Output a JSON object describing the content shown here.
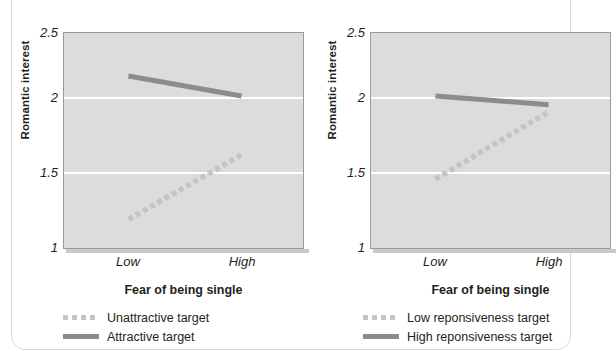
{
  "figure": {
    "panel_count": 2,
    "accent_solid_color": "#8c8c8c",
    "accent_dashed_color": "#c4c4c4",
    "plot_background_color": "#dcdcdc",
    "gridline_color": "#ffffff"
  },
  "panels": [
    {
      "id": "left",
      "ylabel": "Romantic interest",
      "xlabel": "Fear of being single",
      "yticks": [
        "2.5",
        "2",
        "1.5",
        "1"
      ],
      "xticks": [
        "Low",
        "High"
      ],
      "legend": [
        {
          "label": "Unattractive target",
          "style": "dashed"
        },
        {
          "label": "Attractive target",
          "style": "solid"
        }
      ]
    },
    {
      "id": "right",
      "ylabel": "Romantic interest",
      "xlabel": "Fear of being single",
      "yticks": [
        "2.5",
        "2",
        "1.5",
        "1"
      ],
      "xticks": [
        "Low",
        "High"
      ],
      "legend": [
        {
          "label": "Low reponsiveness target",
          "style": "dashed"
        },
        {
          "label": "High reponsiveness target",
          "style": "solid"
        }
      ]
    }
  ],
  "chart_data": [
    {
      "type": "line",
      "panel": "left",
      "title": "",
      "xlabel": "Fear of being single",
      "ylabel": "Romantic interest",
      "categories": [
        "Low",
        "High"
      ],
      "ylim": [
        1,
        2.5
      ],
      "yticks": [
        1,
        1.5,
        2,
        2.5
      ],
      "grid": true,
      "gridlines_at": [
        1.5,
        2
      ],
      "legend_position": "below",
      "series": [
        {
          "name": "Unattractive target",
          "style": "dashed",
          "color": "#c4c4c4",
          "values": [
            1.2,
            1.65
          ]
        },
        {
          "name": "Attractive target",
          "style": "solid",
          "color": "#8c8c8c",
          "values": [
            2.2,
            2.06
          ]
        }
      ]
    },
    {
      "type": "line",
      "panel": "right",
      "title": "",
      "xlabel": "Fear of being single",
      "ylabel": "Romantic interest",
      "categories": [
        "Low",
        "High"
      ],
      "ylim": [
        1,
        2.5
      ],
      "yticks": [
        1,
        1.5,
        2,
        2.5
      ],
      "grid": true,
      "gridlines_at": [
        1.5,
        2
      ],
      "legend_position": "below",
      "series": [
        {
          "name": "Low reponsiveness target",
          "style": "dashed",
          "color": "#c4c4c4",
          "values": [
            1.48,
            1.95
          ]
        },
        {
          "name": "High reponsiveness target",
          "style": "solid",
          "color": "#8c8c8c",
          "values": [
            2.06,
            2.0
          ]
        }
      ]
    }
  ]
}
